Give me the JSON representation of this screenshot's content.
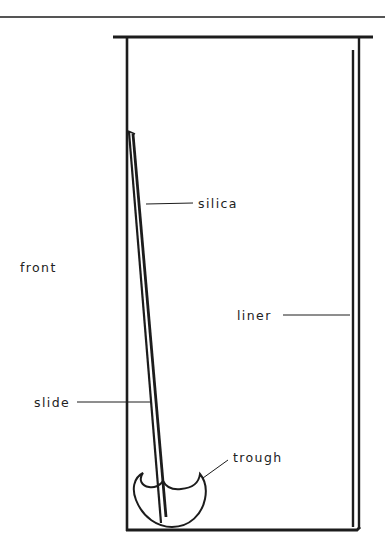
{
  "diagram": {
    "title": "",
    "labels": {
      "silica": "silica",
      "front": "front",
      "liner": "liner",
      "slide": "slide",
      "trough": "trough"
    },
    "colors": {
      "ink": "#1c1c1c",
      "text": "#222222",
      "background": "#ffffff"
    }
  }
}
